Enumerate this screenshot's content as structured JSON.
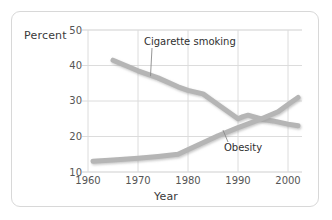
{
  "card": {
    "name": "chart-card"
  },
  "chart_data": {
    "type": "line",
    "title": "",
    "xlabel": "Year",
    "ylabel": "Percent",
    "xlim": [
      1960,
      2002
    ],
    "ylim": [
      10,
      50
    ],
    "xticks": [
      1960,
      1970,
      1980,
      1990,
      2000
    ],
    "yticks": [
      10,
      20,
      30,
      40,
      50
    ],
    "grid": true,
    "legend": "inline-labels",
    "series": [
      {
        "name": "Cigarette smoking",
        "color": "#b5b5b5",
        "x": [
          1965,
          1970,
          1974,
          1978,
          1980,
          1983,
          1985,
          1990,
          1991,
          1992,
          1995,
          1997,
          2000,
          2002
        ],
        "values": [
          41.5,
          38.5,
          36.5,
          34.0,
          33.0,
          32.0,
          30.0,
          25.0,
          25.6,
          26.0,
          24.8,
          24.4,
          23.5,
          23.0
        ]
      },
      {
        "name": "Obesity",
        "color": "#b5b5b5",
        "x": [
          1961,
          1965,
          1970,
          1974,
          1978,
          1982,
          1986,
          1990,
          1994,
          1998,
          2000,
          2002
        ],
        "values": [
          13.0,
          13.4,
          13.9,
          14.4,
          15.0,
          17.6,
          20.2,
          22.5,
          24.6,
          27.0,
          29.0,
          31.0
        ]
      }
    ],
    "annotations": [
      {
        "text": "Cigarette smoking",
        "anchor_x": 1972.5,
        "anchor_y": 37.0
      },
      {
        "text": "Obesity",
        "anchor_x": 1987.0,
        "anchor_y": 21.8
      }
    ]
  }
}
